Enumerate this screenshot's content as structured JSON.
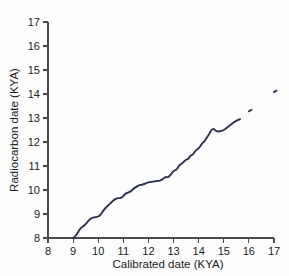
{
  "figure": {
    "background_color": "#fdfdfd",
    "axis_color": "#4a4a4a",
    "text_color": "#1a1a1a"
  },
  "chart_data": {
    "type": "line",
    "title": "",
    "xlabel": "Calibrated date (KYA)",
    "ylabel": "Radiocarbon date (KYA)",
    "xlim": [
      8,
      17
    ],
    "ylim": [
      8,
      17
    ],
    "xticks": [
      8,
      9,
      10,
      11,
      12,
      13,
      14,
      15,
      16,
      17
    ],
    "yticks": [
      8,
      9,
      10,
      11,
      12,
      13,
      14,
      15,
      16,
      17
    ],
    "xtick_labels": [
      "8",
      "9",
      "10",
      "11",
      "12",
      "13",
      "14",
      "15",
      "16",
      "17"
    ],
    "ytick_labels": [
      "8",
      "9",
      "10",
      "11",
      "12",
      "13",
      "14",
      "15",
      "16",
      "17"
    ],
    "grid": false,
    "legend": null,
    "line_color": "#2b3152",
    "line_width": 1.9,
    "series": [
      {
        "name": "Calibration curve",
        "x": [
          9.0,
          9.05,
          9.1,
          9.15,
          9.2,
          9.25,
          9.3,
          9.35,
          9.4,
          9.45,
          9.5,
          9.55,
          9.6,
          9.65,
          9.7,
          9.75,
          9.8,
          9.85,
          9.9,
          9.95,
          10.0,
          10.05,
          10.1,
          10.15,
          10.2,
          10.25,
          10.3,
          10.35,
          10.4,
          10.45,
          10.5,
          10.55,
          10.6,
          10.65,
          10.7,
          10.75,
          10.8,
          10.85,
          10.9,
          10.95,
          11.0,
          11.05,
          11.1,
          11.15,
          11.2,
          11.25,
          11.3,
          11.35,
          11.4,
          11.45,
          11.5,
          11.55,
          11.6,
          11.65,
          11.7,
          11.75,
          11.8,
          11.85,
          11.9,
          11.95,
          12.0,
          12.05,
          12.1,
          12.15,
          12.2,
          12.25,
          12.3,
          12.35,
          12.4,
          12.45,
          12.5,
          12.55,
          12.6,
          12.65,
          12.7,
          12.75,
          12.8,
          12.85,
          12.9,
          12.95,
          13.0,
          13.05,
          13.1,
          13.15,
          13.2,
          13.25,
          13.3,
          13.35,
          13.4,
          13.45,
          13.5,
          13.55,
          13.6,
          13.65,
          13.7,
          13.75,
          13.8,
          13.85,
          13.9,
          13.95,
          14.0,
          14.05,
          14.1,
          14.15,
          14.2,
          14.25,
          14.3,
          14.35,
          14.4,
          14.45,
          14.5,
          14.55,
          14.6,
          14.65,
          14.7,
          14.75,
          14.8,
          14.85,
          14.9,
          14.95,
          15.0,
          15.05,
          15.1,
          15.15,
          15.2,
          15.25,
          15.3,
          15.35,
          15.4,
          15.45,
          15.5,
          15.55,
          15.6,
          15.65
        ],
        "y": [
          8.0,
          8.04,
          8.1,
          8.17,
          8.25,
          8.33,
          8.4,
          8.45,
          8.49,
          8.53,
          8.58,
          8.64,
          8.7,
          8.76,
          8.8,
          8.83,
          8.85,
          8.86,
          8.87,
          8.88,
          8.9,
          8.93,
          8.98,
          9.05,
          9.13,
          9.2,
          9.26,
          9.31,
          9.36,
          9.41,
          9.46,
          9.51,
          9.56,
          9.6,
          9.63,
          9.65,
          9.66,
          9.66,
          9.67,
          9.7,
          9.75,
          9.81,
          9.85,
          9.88,
          9.9,
          9.92,
          9.95,
          10.0,
          10.05,
          10.09,
          10.12,
          10.15,
          10.18,
          10.2,
          10.21,
          10.22,
          10.24,
          10.26,
          10.28,
          10.3,
          10.32,
          10.33,
          10.34,
          10.34,
          10.35,
          10.36,
          10.37,
          10.38,
          10.38,
          10.39,
          10.41,
          10.44,
          10.48,
          10.52,
          10.54,
          10.53,
          10.55,
          10.6,
          10.66,
          10.72,
          10.78,
          10.82,
          10.84,
          10.9,
          10.98,
          11.04,
          11.08,
          11.12,
          11.17,
          11.22,
          11.26,
          11.28,
          11.32,
          11.4,
          11.45,
          11.47,
          11.52,
          11.6,
          11.66,
          11.7,
          11.74,
          11.8,
          11.88,
          11.95,
          12.0,
          12.06,
          12.14,
          12.22,
          12.3,
          12.4,
          12.48,
          12.53,
          12.54,
          12.5,
          12.46,
          12.44,
          12.44,
          12.45,
          12.46,
          12.48,
          12.5,
          12.53,
          12.57,
          12.62,
          12.66,
          12.7,
          12.74,
          12.78,
          12.82,
          12.85,
          12.88,
          12.91,
          12.93,
          12.95
        ]
      },
      {
        "name": "Fragment A",
        "x": [
          16.0,
          16.1
        ],
        "y": [
          13.28,
          13.34
        ]
      },
      {
        "name": "Fragment B",
        "x": [
          17.0,
          17.1
        ],
        "y": [
          14.08,
          14.14
        ]
      }
    ],
    "annotations": []
  }
}
